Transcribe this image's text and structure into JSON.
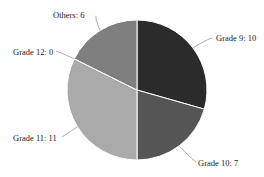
{
  "chart_data": {
    "type": "pie",
    "title": "",
    "categories": [
      "Grade 9",
      "Grade 10",
      "Grade 11",
      "Grade 12",
      "Others"
    ],
    "values": [
      10,
      7,
      11,
      0,
      6
    ],
    "labels": [
      "Grade 9: 10",
      "Grade 10: 7",
      "Grade 11: 11",
      "Grade 12: 0",
      "Others: 6"
    ],
    "colors": [
      "#2b2b2b",
      "#555555",
      "#aaaaaa",
      "#cfcfcf",
      "#7f7f7f"
    ],
    "start_angle": "12 o'clock",
    "direction": "clockwise",
    "legend": "none"
  }
}
